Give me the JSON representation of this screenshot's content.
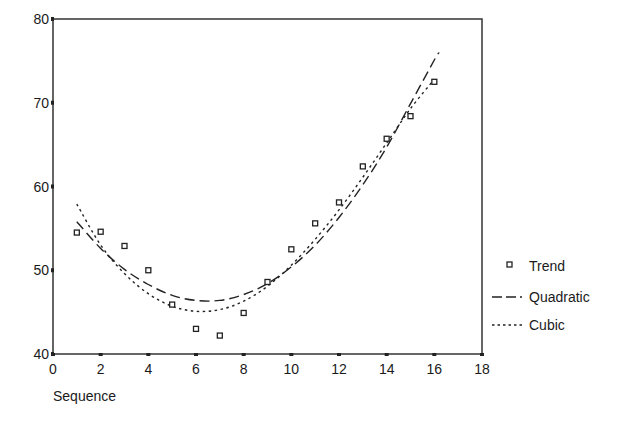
{
  "chart_data": {
    "type": "scatter",
    "title": "",
    "xlabel": "Sequence",
    "ylabel": "",
    "xlim": [
      0,
      18
    ],
    "ylim": [
      40,
      80
    ],
    "x_ticks": [
      "0",
      "2",
      "4",
      "6",
      "8",
      "10",
      "12",
      "14",
      "16",
      "18"
    ],
    "y_ticks": [
      "40",
      "50",
      "60",
      "70",
      "80"
    ],
    "grid": false,
    "legend_position": "right",
    "series": [
      {
        "name": "Trend",
        "kind": "markers",
        "marker": "open-square",
        "x": [
          1,
          2,
          3,
          4,
          5,
          6,
          7,
          8,
          9,
          10,
          11,
          12,
          13,
          14,
          15,
          16
        ],
        "values": [
          54.5,
          54.6,
          52.9,
          50.0,
          45.9,
          43.0,
          42.2,
          44.9,
          48.6,
          52.5,
          55.6,
          58.1,
          62.4,
          65.7,
          68.4,
          72.5
        ]
      },
      {
        "name": "Quadratic",
        "kind": "line",
        "dash": "long-dash",
        "x": [
          1,
          2,
          3,
          4,
          5,
          6,
          7,
          8,
          9,
          10,
          11,
          12,
          13,
          14,
          15,
          16,
          16.2
        ],
        "values": [
          55.8,
          52.6,
          50.1,
          48.3,
          47.0,
          46.4,
          46.4,
          47.1,
          48.4,
          50.4,
          53.0,
          56.3,
          60.2,
          64.7,
          69.9,
          75.1,
          76.0
        ]
      },
      {
        "name": "Cubic",
        "kind": "line",
        "dash": "short-dot",
        "x": [
          1,
          2,
          3,
          4,
          5,
          6,
          7,
          8,
          9,
          10,
          11,
          12,
          13,
          14,
          15,
          16
        ],
        "values": [
          57.9,
          53.0,
          49.6,
          47.2,
          45.7,
          45.1,
          45.3,
          46.3,
          48.1,
          50.6,
          53.7,
          57.2,
          61.1,
          65.2,
          69.3,
          72.8
        ]
      }
    ]
  },
  "legend": {
    "items": [
      {
        "label": "Trend"
      },
      {
        "label": "Quadratic"
      },
      {
        "label": "Cubic"
      }
    ]
  }
}
